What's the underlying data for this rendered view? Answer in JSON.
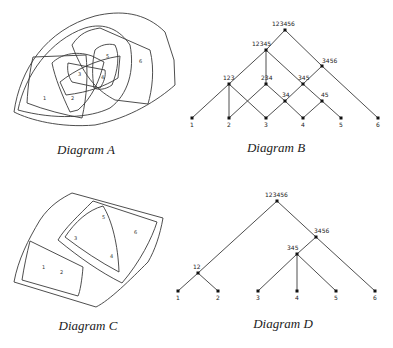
{
  "captions": {
    "a": "Diagram A",
    "b": "Diagram B",
    "c": "Diagram C",
    "d": "Diagram D"
  },
  "diagram_a": {
    "type": "nested overlapping regions (Venn-like)",
    "elements": [
      "1",
      "2",
      "3",
      "4",
      "5",
      "6"
    ],
    "regions": [
      "123",
      "234",
      "345",
      "34",
      "45",
      "12345",
      "3456",
      "123456"
    ]
  },
  "diagram_b": {
    "type": "lattice",
    "nodes": [
      {
        "id": "123456",
        "label": "123456"
      },
      {
        "id": "12345",
        "label": "12345"
      },
      {
        "id": "3456",
        "label": "3456"
      },
      {
        "id": "123",
        "label": "123"
      },
      {
        "id": "234",
        "label": "234"
      },
      {
        "id": "345",
        "label": "345"
      },
      {
        "id": "34",
        "label": "34"
      },
      {
        "id": "45",
        "label": "45"
      },
      {
        "id": "1",
        "label": "1"
      },
      {
        "id": "2",
        "label": "2"
      },
      {
        "id": "3",
        "label": "3"
      },
      {
        "id": "4",
        "label": "4"
      },
      {
        "id": "5",
        "label": "5"
      },
      {
        "id": "6",
        "label": "6"
      }
    ],
    "edges": [
      [
        "123456",
        "12345"
      ],
      [
        "123456",
        "3456"
      ],
      [
        "12345",
        "123"
      ],
      [
        "12345",
        "234"
      ],
      [
        "12345",
        "345"
      ],
      [
        "3456",
        "345"
      ],
      [
        "3456",
        "6"
      ],
      [
        "123",
        "1"
      ],
      [
        "123",
        "2"
      ],
      [
        "123",
        "3"
      ],
      [
        "234",
        "2"
      ],
      [
        "234",
        "34"
      ],
      [
        "345",
        "34"
      ],
      [
        "345",
        "45"
      ],
      [
        "34",
        "3"
      ],
      [
        "34",
        "4"
      ],
      [
        "45",
        "4"
      ],
      [
        "45",
        "5"
      ]
    ]
  },
  "diagram_c": {
    "type": "nested regions (hierarchy)",
    "elements": [
      "1",
      "2",
      "3",
      "4",
      "5",
      "6"
    ],
    "regions": [
      "12",
      "345",
      "3456",
      "123456"
    ]
  },
  "diagram_d": {
    "type": "tree",
    "nodes": [
      {
        "id": "123456",
        "label": "123456"
      },
      {
        "id": "3456",
        "label": "3456"
      },
      {
        "id": "345",
        "label": "345"
      },
      {
        "id": "12",
        "label": "12"
      },
      {
        "id": "1",
        "label": "1"
      },
      {
        "id": "2",
        "label": "2"
      },
      {
        "id": "3",
        "label": "3"
      },
      {
        "id": "4",
        "label": "4"
      },
      {
        "id": "5",
        "label": "5"
      },
      {
        "id": "6",
        "label": "6"
      }
    ],
    "edges": [
      [
        "123456",
        "12"
      ],
      [
        "123456",
        "3456"
      ],
      [
        "12",
        "1"
      ],
      [
        "12",
        "2"
      ],
      [
        "3456",
        "345"
      ],
      [
        "3456",
        "6"
      ],
      [
        "345",
        "3"
      ],
      [
        "345",
        "4"
      ],
      [
        "345",
        "5"
      ]
    ]
  }
}
